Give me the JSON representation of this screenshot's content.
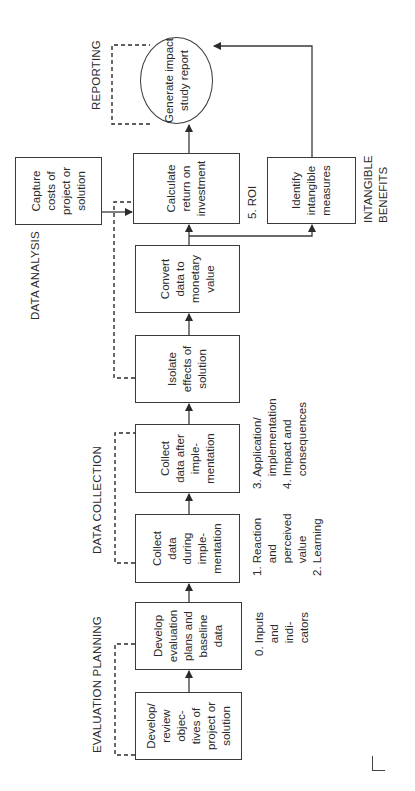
{
  "diagram": {
    "orientation": "rotated 90 degrees counter-clockwise",
    "phases": {
      "evaluation_planning": "EVALUATION PLANNING",
      "data_collection": "DATA COLLECTION",
      "data_analysis": "DATA ANALYSIS",
      "reporting": "REPORTING",
      "intangible_benefits": "INTANGIBLE\nBENEFITS"
    },
    "boxes": {
      "develop_objectives": "Develop/\nreview\nobjec-\ntives of\nproject or\nsolution",
      "develop_plans": "Develop\nevaluation\nplans and\nbaseline\ndata",
      "collect_during": "Collect\ndata\nduring\nimple-\nmentation",
      "collect_after": "Collect\ndata after\nimple-\nmentation",
      "isolate_effects": "Isolate\neffects of\nsolution",
      "convert_data": "Convert\ndata to\nmonetary\nvalue",
      "calculate_roi": "Calculate\nreturn on\ninvestment",
      "capture_costs": "Capture\ncosts of\nproject or\nsolution",
      "identify_intangible": "Identify\nintangible\nmeasures",
      "generate_report": "Generate impact\nstudy report"
    },
    "levels": {
      "level0": "0. Inputs\n    and\n    indi-\n    cators",
      "level1_2": "1. Reaction\n    and\n    perceived\n    value\n2. Learning",
      "level3_4": "3. Application/\n    implementation\n4. Impact and\n    consequences",
      "level5": "5. ROI"
    },
    "colors": {
      "line": "#3a3a3a",
      "text": "#2b2b2b",
      "background": "#ffffff"
    }
  }
}
